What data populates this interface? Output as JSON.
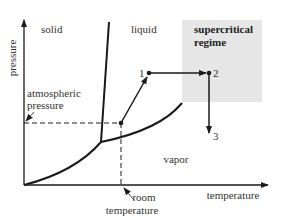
{
  "diagram": {
    "type": "phase-diagram",
    "axes": {
      "y_label": "pressure",
      "x_label": "temperature"
    },
    "regions": {
      "solid": "solid",
      "liquid": "liquid",
      "vapor": "vapor",
      "supercritical_line1": "supercritical",
      "supercritical_line2": "regime"
    },
    "annotations": {
      "atmospheric_line1": "atmospheric",
      "atmospheric_line2": "pressure",
      "room_line1": "room",
      "room_line2": "temperature"
    },
    "points": [
      {
        "label": "1"
      },
      {
        "label": "2"
      },
      {
        "label": "3"
      }
    ],
    "colors": {
      "line": "#1a1a1a",
      "supercritical_fill": "#e6e6e6",
      "text": "#333333"
    }
  }
}
